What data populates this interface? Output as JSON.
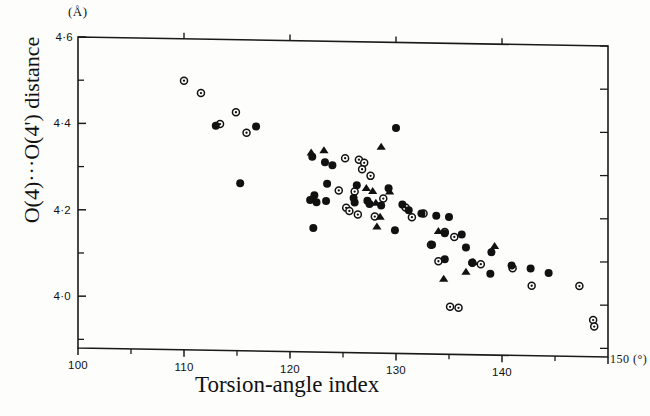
{
  "figure": {
    "y_unit": "(Å)",
    "x_unit": "150 (°)",
    "y_axis_title": "O(4)···O(4') distance",
    "x_axis_title": "Torsion-angle index",
    "frame_color": "#1a1a1a",
    "marker_color": "#111111",
    "background": "#fdfdfc"
  },
  "chart_data": {
    "type": "scatter",
    "title": "",
    "xlabel": "Torsion-angle index",
    "ylabel": "O(4)···O(4') distance",
    "xunit": "°",
    "yunit": "Å",
    "xlim": [
      100,
      150
    ],
    "ylim": [
      3.88,
      4.6
    ],
    "grid": false,
    "legend_position": "none",
    "xticks": [
      100,
      110,
      120,
      130,
      140,
      150
    ],
    "xtick_labels": [
      "100",
      "110",
      "120",
      "130",
      "140",
      "150"
    ],
    "xminor_ticks": [
      105,
      115,
      125,
      135,
      145
    ],
    "yticks": [
      4.0,
      4.2,
      4.4,
      4.6
    ],
    "ytick_labels": [
      "4·0",
      "4·2",
      "4·4",
      "4·6"
    ],
    "yminor_ticks": [
      3.9,
      4.1,
      4.3,
      4.5
    ],
    "series": [
      {
        "name": "open-circle",
        "marker": "open-circle",
        "points": [
          [
            110.0,
            4.503
          ],
          [
            111.6,
            4.475
          ],
          [
            114.9,
            4.432
          ],
          [
            113.4,
            4.404
          ],
          [
            115.9,
            4.385
          ],
          [
            125.2,
            4.33
          ],
          [
            126.5,
            4.327
          ],
          [
            127.0,
            4.32
          ],
          [
            126.8,
            4.305
          ],
          [
            127.6,
            4.29
          ],
          [
            124.6,
            4.255
          ],
          [
            126.1,
            4.253
          ],
          [
            128.8,
            4.238
          ],
          [
            125.3,
            4.215
          ],
          [
            125.6,
            4.208
          ],
          [
            126.4,
            4.2
          ],
          [
            128.0,
            4.196
          ],
          [
            130.9,
            4.218
          ],
          [
            132.6,
            4.205
          ],
          [
            131.5,
            4.196
          ],
          [
            134.6,
            4.163
          ],
          [
            135.5,
            4.152
          ],
          [
            133.3,
            4.133
          ],
          [
            134.0,
            4.095
          ],
          [
            137.2,
            4.093
          ],
          [
            138.0,
            4.09
          ],
          [
            141.0,
            4.082
          ],
          [
            142.8,
            4.042
          ],
          [
            147.3,
            4.043
          ],
          [
            135.1,
            3.99
          ],
          [
            135.9,
            3.988
          ],
          [
            148.6,
            3.965
          ],
          [
            148.7,
            3.95
          ]
        ]
      },
      {
        "name": "filled-circle",
        "marker": "filled-circle",
        "points": [
          [
            113.0,
            4.4
          ],
          [
            116.8,
            4.4
          ],
          [
            130.0,
            4.402
          ],
          [
            122.1,
            4.332
          ],
          [
            123.3,
            4.32
          ],
          [
            124.0,
            4.313
          ],
          [
            115.3,
            4.268
          ],
          [
            123.5,
            4.27
          ],
          [
            122.3,
            4.243
          ],
          [
            126.3,
            4.268
          ],
          [
            129.3,
            4.262
          ],
          [
            121.9,
            4.232
          ],
          [
            122.5,
            4.227
          ],
          [
            123.4,
            4.23
          ],
          [
            126.0,
            4.238
          ],
          [
            126.1,
            4.228
          ],
          [
            127.3,
            4.232
          ],
          [
            127.5,
            4.225
          ],
          [
            128.6,
            4.222
          ],
          [
            130.6,
            4.225
          ],
          [
            131.2,
            4.212
          ],
          [
            132.4,
            4.205
          ],
          [
            133.8,
            4.2
          ],
          [
            135.0,
            4.198
          ],
          [
            122.2,
            4.167
          ],
          [
            129.9,
            4.165
          ],
          [
            134.6,
            4.16
          ],
          [
            136.2,
            4.158
          ],
          [
            133.4,
            4.133
          ],
          [
            136.6,
            4.128
          ],
          [
            139.0,
            4.118
          ],
          [
            134.6,
            4.1
          ],
          [
            137.2,
            4.093
          ],
          [
            140.9,
            4.088
          ],
          [
            142.7,
            4.082
          ],
          [
            144.4,
            4.072
          ],
          [
            138.9,
            4.068
          ]
        ]
      },
      {
        "name": "filled-triangle",
        "marker": "filled-triangle",
        "points": [
          [
            122.0,
            4.342
          ],
          [
            123.2,
            4.348
          ],
          [
            128.6,
            4.358
          ],
          [
            127.2,
            4.262
          ],
          [
            127.8,
            4.255
          ],
          [
            129.4,
            4.255
          ],
          [
            128.1,
            4.228
          ],
          [
            128.5,
            4.196
          ],
          [
            128.2,
            4.173
          ],
          [
            134.0,
            4.165
          ],
          [
            139.3,
            4.133
          ],
          [
            137.3,
            4.095
          ],
          [
            136.6,
            4.072
          ],
          [
            134.5,
            4.055
          ]
        ]
      }
    ]
  }
}
